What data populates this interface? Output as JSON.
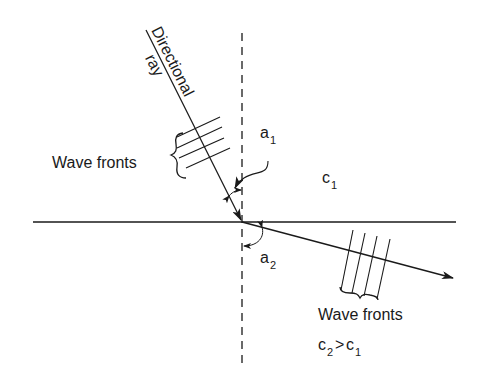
{
  "diagram": {
    "labels": {
      "ray_line1": "Directional",
      "ray_line2": "ray",
      "wave_fronts_upper": "Wave fronts",
      "wave_fronts_lower": "Wave fronts",
      "angle1_base": "a",
      "angle1_sub": "1",
      "angle2_base": "a",
      "angle2_sub": "2",
      "medium1_base": "c",
      "medium1_sub": "1",
      "medium2_base_a": "c",
      "medium2_sub_a": "2",
      "medium2_op": ">",
      "medium2_base_b": "c",
      "medium2_sub_b": "1"
    },
    "colors": {
      "ink": "#1a1a1a",
      "background": "#ffffff"
    }
  }
}
